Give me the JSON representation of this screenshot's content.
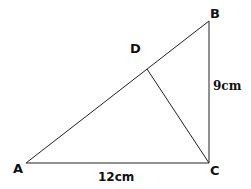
{
  "diagram": {
    "type": "geometry",
    "points": {
      "A": {
        "label": "A",
        "x": 26,
        "y": 163
      },
      "B": {
        "label": "B",
        "x": 209,
        "y": 21
      },
      "C": {
        "label": "C",
        "x": 209,
        "y": 163
      },
      "D": {
        "label": "D",
        "x": 147,
        "y": 69
      }
    },
    "segments": [
      {
        "from": "A",
        "to": "B"
      },
      {
        "from": "B",
        "to": "C"
      },
      {
        "from": "A",
        "to": "C"
      },
      {
        "from": "C",
        "to": "D"
      }
    ],
    "measurements": {
      "AC": "12cm",
      "BC": "9cm"
    },
    "line_color": "#222222"
  }
}
